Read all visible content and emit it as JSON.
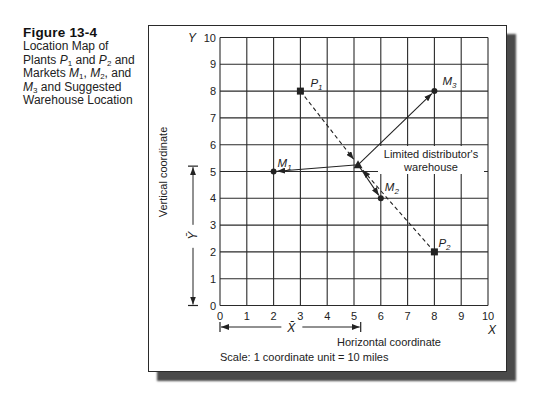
{
  "caption": {
    "title": "Figure 13-4",
    "lines": [
      [
        "Location Map of"
      ],
      [
        "Plants ",
        "P",
        "1",
        " and ",
        "P",
        "2",
        " and"
      ],
      [
        "Markets ",
        "M",
        "1",
        ", ",
        "M",
        "2",
        ", and"
      ],
      [
        "M",
        "3",
        " and Suggested"
      ],
      [
        "Warehouse Location"
      ]
    ]
  },
  "chart_data": {
    "type": "scatter",
    "title": "Location Map of Plants P1 and P2 and Markets M1, M2, and M3 and Suggested Warehouse Location",
    "xlabel": "Horizontal coordinate",
    "ylabel": "Vertical coordinate",
    "x_axis_letter": "X",
    "y_axis_letter": "Y",
    "xlim": [
      0,
      10
    ],
    "ylim": [
      0,
      10
    ],
    "x_ticks": [
      0,
      1,
      2,
      3,
      4,
      5,
      6,
      7,
      8,
      9,
      10
    ],
    "y_ticks": [
      0,
      1,
      2,
      3,
      4,
      5,
      6,
      7,
      8,
      9,
      10
    ],
    "grid": true,
    "note": "Scale: 1 coordinate unit = 10 miles",
    "points": [
      {
        "id": "P1",
        "label_base": "P",
        "label_sub": "1",
        "kind": "plant",
        "x": 3,
        "y": 8
      },
      {
        "id": "P2",
        "label_base": "P",
        "label_sub": "2",
        "kind": "plant",
        "x": 8,
        "y": 2
      },
      {
        "id": "M1",
        "label_base": "M",
        "label_sub": "1",
        "kind": "market",
        "x": 2,
        "y": 5
      },
      {
        "id": "M2",
        "label_base": "M",
        "label_sub": "2",
        "kind": "market",
        "x": 6,
        "y": 4
      },
      {
        "id": "M3",
        "label_base": "M",
        "label_sub": "3",
        "kind": "market",
        "x": 8,
        "y": 8
      },
      {
        "id": "W",
        "label_base": "",
        "label_sub": "",
        "kind": "warehouse",
        "x": 5.15,
        "y": 5.25
      }
    ],
    "warehouse_label": [
      "Limited distributor's",
      "warehouse"
    ],
    "flows": [
      {
        "from": "P1",
        "to": "W",
        "style": "dashed"
      },
      {
        "from": "P2",
        "to": "W",
        "style": "dashed"
      },
      {
        "from": "W",
        "to": "M1",
        "style": "solid"
      },
      {
        "from": "W",
        "to": "M2",
        "style": "solid"
      },
      {
        "from": "W",
        "to": "M3",
        "style": "solid"
      }
    ],
    "center_of_gravity": {
      "x_bar": 5.25,
      "y_bar": 5.2,
      "x_bar_label": "X̄",
      "y_bar_label": "Ȳ"
    },
    "colors": {
      "ink": "#222222",
      "grid": "#2a2a2a",
      "shadow": "#4a4a4a"
    }
  }
}
